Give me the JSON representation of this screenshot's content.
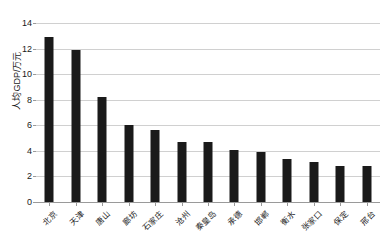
{
  "chart_data": {
    "type": "bar",
    "title": "",
    "subtitle": "",
    "xlabel": "",
    "ylabel": "人均GDP/万元",
    "ylim": [
      0,
      14
    ],
    "ytick_labels": [
      "0",
      "2",
      "4",
      "6",
      "8",
      "10",
      "12",
      "14"
    ],
    "ytick_values": [
      0,
      2,
      4,
      6,
      8,
      10,
      12,
      14
    ],
    "grid": true,
    "legend": false,
    "legend_position": "none",
    "categories": [
      "北京",
      "天津",
      "唐山",
      "廊坊",
      "石家庄",
      "沧州",
      "秦皇岛",
      "承德",
      "邯郸",
      "衡水",
      "张家口",
      "保定",
      "邢台"
    ],
    "values": [
      12.9,
      11.9,
      8.2,
      6.0,
      5.6,
      4.7,
      4.7,
      4.1,
      3.9,
      3.35,
      3.15,
      2.85,
      2.8
    ],
    "series": [
      {
        "name": "人均GDP",
        "values": [
          12.9,
          11.9,
          8.2,
          6.0,
          5.6,
          4.7,
          4.7,
          4.1,
          3.9,
          3.35,
          3.15,
          2.85,
          2.8
        ]
      }
    ],
    "bar_color": "#1a1a1a",
    "gridline_color": "#d0d0d0",
    "axis_color": "#9a9a9a"
  }
}
